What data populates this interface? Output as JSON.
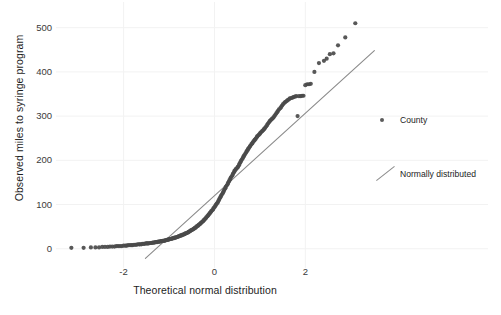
{
  "chart_data": {
    "type": "scatter",
    "title": "",
    "subtitle": "",
    "xlabel": "Theoretical normal distribution",
    "ylabel": "Observed miles to syringe program",
    "xlim": [
      -3.4,
      3.6
    ],
    "ylim": [
      -30,
      540
    ],
    "xticks": [
      -2,
      0,
      2
    ],
    "xtick_labels": [
      "-2",
      "0",
      "2"
    ],
    "yticks": [
      0,
      100,
      200,
      300,
      400,
      500
    ],
    "ytick_labels": [
      "0",
      "100",
      "200",
      "300",
      "400",
      "500"
    ],
    "grid": true,
    "grid_color": "#f2f2f2",
    "background": "#ffffff",
    "legend_position": "right",
    "legend": [
      {
        "label": "County",
        "marker": "point",
        "color": "#5b5b5b"
      },
      {
        "label": "Normally distributed",
        "marker": "line",
        "color": "#8a8a8a"
      }
    ],
    "series": [
      {
        "name": "County",
        "type": "scatter",
        "color": "#4a4a4a",
        "marker_size": 3.0,
        "points": [
          [
            -3.15,
            2
          ],
          [
            -2.88,
            2
          ],
          [
            -2.72,
            3
          ],
          [
            -2.62,
            3
          ],
          [
            -2.54,
            3
          ],
          [
            -2.47,
            4
          ],
          [
            -2.41,
            4
          ],
          [
            -2.35,
            4
          ],
          [
            -2.3,
            5
          ],
          [
            -2.25,
            5
          ],
          [
            -2.2,
            5
          ],
          [
            -2.16,
            6
          ],
          [
            -2.12,
            6
          ],
          [
            -2.08,
            6
          ],
          [
            -2.04,
            6
          ],
          [
            -2.0,
            7
          ],
          [
            -1.96,
            7
          ],
          [
            -1.93,
            7
          ],
          [
            -1.9,
            8
          ],
          [
            -1.86,
            8
          ],
          [
            -1.83,
            8
          ],
          [
            -1.8,
            8
          ],
          [
            -1.77,
            9
          ],
          [
            -1.74,
            9
          ],
          [
            -1.72,
            9
          ],
          [
            -1.69,
            10
          ],
          [
            -1.66,
            10
          ],
          [
            -1.64,
            10
          ],
          [
            -1.61,
            10
          ],
          [
            -1.59,
            11
          ],
          [
            -1.56,
            11
          ],
          [
            -1.54,
            11
          ],
          [
            -1.51,
            12
          ],
          [
            -1.49,
            12
          ],
          [
            -1.47,
            12
          ],
          [
            -1.45,
            12
          ],
          [
            -1.42,
            13
          ],
          [
            -1.4,
            13
          ],
          [
            -1.38,
            13
          ],
          [
            -1.36,
            14
          ],
          [
            -1.34,
            14
          ],
          [
            -1.32,
            14
          ],
          [
            -1.3,
            15
          ],
          [
            -1.28,
            15
          ],
          [
            -1.26,
            15
          ],
          [
            -1.24,
            16
          ],
          [
            -1.22,
            16
          ],
          [
            -1.2,
            16
          ],
          [
            -1.18,
            17
          ],
          [
            -1.16,
            17
          ],
          [
            -1.14,
            18
          ],
          [
            -1.12,
            18
          ],
          [
            -1.1,
            18
          ],
          [
            -1.09,
            19
          ],
          [
            -1.07,
            19
          ],
          [
            -1.05,
            20
          ],
          [
            -1.03,
            20
          ],
          [
            -1.01,
            21
          ],
          [
            -1.0,
            21
          ],
          [
            -0.98,
            22
          ],
          [
            -0.96,
            22
          ],
          [
            -0.94,
            23
          ],
          [
            -0.93,
            23
          ],
          [
            -0.91,
            24
          ],
          [
            -0.89,
            24
          ],
          [
            -0.88,
            25
          ],
          [
            -0.86,
            25
          ],
          [
            -0.84,
            26
          ],
          [
            -0.83,
            26
          ],
          [
            -0.81,
            27
          ],
          [
            -0.79,
            28
          ],
          [
            -0.78,
            28
          ],
          [
            -0.76,
            29
          ],
          [
            -0.74,
            30
          ],
          [
            -0.73,
            30
          ],
          [
            -0.71,
            31
          ],
          [
            -0.7,
            32
          ],
          [
            -0.68,
            32
          ],
          [
            -0.66,
            33
          ],
          [
            -0.65,
            34
          ],
          [
            -0.63,
            35
          ],
          [
            -0.62,
            35
          ],
          [
            -0.6,
            36
          ],
          [
            -0.58,
            37
          ],
          [
            -0.57,
            38
          ],
          [
            -0.55,
            39
          ],
          [
            -0.54,
            40
          ],
          [
            -0.52,
            41
          ],
          [
            -0.51,
            42
          ],
          [
            -0.49,
            43
          ],
          [
            -0.47,
            44
          ],
          [
            -0.46,
            45
          ],
          [
            -0.44,
            46
          ],
          [
            -0.43,
            47
          ],
          [
            -0.41,
            48
          ],
          [
            -0.4,
            50
          ],
          [
            -0.38,
            51
          ],
          [
            -0.36,
            52
          ],
          [
            -0.35,
            54
          ],
          [
            -0.33,
            55
          ],
          [
            -0.32,
            56
          ],
          [
            -0.3,
            58
          ],
          [
            -0.29,
            59
          ],
          [
            -0.27,
            61
          ],
          [
            -0.25,
            62
          ],
          [
            -0.24,
            64
          ],
          [
            -0.22,
            66
          ],
          [
            -0.21,
            67
          ],
          [
            -0.19,
            69
          ],
          [
            -0.18,
            71
          ],
          [
            -0.16,
            73
          ],
          [
            -0.14,
            75
          ],
          [
            -0.13,
            77
          ],
          [
            -0.11,
            79
          ],
          [
            -0.1,
            81
          ],
          [
            -0.08,
            83
          ],
          [
            -0.07,
            85
          ],
          [
            -0.05,
            87
          ],
          [
            -0.03,
            89
          ],
          [
            -0.02,
            92
          ],
          [
            0.0,
            94
          ],
          [
            0.02,
            97
          ],
          [
            0.03,
            99
          ],
          [
            0.05,
            102
          ],
          [
            0.07,
            104
          ],
          [
            0.08,
            107
          ],
          [
            0.1,
            110
          ],
          [
            0.11,
            113
          ],
          [
            0.13,
            116
          ],
          [
            0.14,
            119
          ],
          [
            0.16,
            122
          ],
          [
            0.18,
            125
          ],
          [
            0.19,
            128
          ],
          [
            0.21,
            131
          ],
          [
            0.22,
            134
          ],
          [
            0.24,
            137
          ],
          [
            0.25,
            140
          ],
          [
            0.27,
            143
          ],
          [
            0.29,
            146
          ],
          [
            0.3,
            149
          ],
          [
            0.32,
            152
          ],
          [
            0.33,
            155
          ],
          [
            0.35,
            158
          ],
          [
            0.36,
            161
          ],
          [
            0.38,
            164
          ],
          [
            0.4,
            167
          ],
          [
            0.41,
            170
          ],
          [
            0.43,
            173
          ],
          [
            0.44,
            176
          ],
          [
            0.46,
            178
          ],
          [
            0.47,
            180
          ],
          [
            0.49,
            182
          ],
          [
            0.51,
            184
          ],
          [
            0.52,
            186
          ],
          [
            0.54,
            189
          ],
          [
            0.55,
            192
          ],
          [
            0.57,
            195
          ],
          [
            0.58,
            198
          ],
          [
            0.6,
            201
          ],
          [
            0.62,
            204
          ],
          [
            0.63,
            207
          ],
          [
            0.65,
            210
          ],
          [
            0.66,
            212
          ],
          [
            0.68,
            215
          ],
          [
            0.7,
            218
          ],
          [
            0.71,
            221
          ],
          [
            0.73,
            223
          ],
          [
            0.74,
            226
          ],
          [
            0.76,
            228
          ],
          [
            0.78,
            231
          ],
          [
            0.79,
            233
          ],
          [
            0.81,
            236
          ],
          [
            0.83,
            238
          ],
          [
            0.84,
            240
          ],
          [
            0.86,
            243
          ],
          [
            0.88,
            245
          ],
          [
            0.89,
            247
          ],
          [
            0.91,
            249
          ],
          [
            0.93,
            252
          ],
          [
            0.94,
            254
          ],
          [
            0.96,
            256
          ],
          [
            0.98,
            258
          ],
          [
            1.0,
            260
          ],
          [
            1.01,
            262
          ],
          [
            1.03,
            264
          ],
          [
            1.05,
            266
          ],
          [
            1.07,
            268
          ],
          [
            1.09,
            270
          ],
          [
            1.1,
            272
          ],
          [
            1.12,
            274
          ],
          [
            1.14,
            277
          ],
          [
            1.16,
            280
          ],
          [
            1.18,
            283
          ],
          [
            1.2,
            286
          ],
          [
            1.22,
            289
          ],
          [
            1.24,
            291
          ],
          [
            1.26,
            293
          ],
          [
            1.28,
            295
          ],
          [
            1.3,
            297
          ],
          [
            1.32,
            300
          ],
          [
            1.34,
            303
          ],
          [
            1.36,
            306
          ],
          [
            1.38,
            309
          ],
          [
            1.4,
            312
          ],
          [
            1.42,
            315
          ],
          [
            1.45,
            318
          ],
          [
            1.47,
            321
          ],
          [
            1.49,
            324
          ],
          [
            1.51,
            327
          ],
          [
            1.54,
            330
          ],
          [
            1.56,
            332
          ],
          [
            1.59,
            334
          ],
          [
            1.61,
            336
          ],
          [
            1.64,
            338
          ],
          [
            1.66,
            340
          ],
          [
            1.69,
            341
          ],
          [
            1.72,
            342
          ],
          [
            1.74,
            343
          ],
          [
            1.77,
            344
          ],
          [
            1.8,
            345
          ],
          [
            1.83,
            300
          ],
          [
            1.86,
            345
          ],
          [
            1.9,
            345
          ],
          [
            1.93,
            346
          ],
          [
            1.96,
            346
          ],
          [
            2.0,
            370
          ],
          [
            2.04,
            372
          ],
          [
            2.08,
            372
          ],
          [
            2.12,
            373
          ],
          [
            2.2,
            400
          ],
          [
            2.3,
            420
          ],
          [
            2.41,
            425
          ],
          [
            2.47,
            430
          ],
          [
            2.54,
            440
          ],
          [
            2.62,
            442
          ],
          [
            2.72,
            460
          ],
          [
            2.88,
            478
          ],
          [
            3.1,
            510
          ]
        ]
      },
      {
        "name": "Normally distributed",
        "type": "line",
        "color": "#8a8a8a",
        "x0": -1.52,
        "y0": -22,
        "x1": 3.52,
        "y1": 448
      }
    ]
  }
}
